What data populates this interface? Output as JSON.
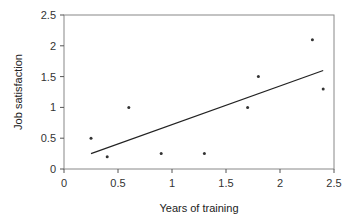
{
  "chart_data": {
    "type": "scatter",
    "title": "",
    "xlabel": "Years of training",
    "ylabel": "Job satisfaction",
    "xlim": [
      0,
      2.5
    ],
    "ylim": [
      0,
      2.5
    ],
    "xticks": [
      "0",
      "0.5",
      "1",
      "1.5",
      "2",
      "2.5"
    ],
    "yticks": [
      "0",
      "0.5",
      "1",
      "1.5",
      "2",
      "2.5"
    ],
    "grid": false,
    "legend": null,
    "series": [
      {
        "name": "observations",
        "points": [
          {
            "x": 0.25,
            "y": 0.5
          },
          {
            "x": 0.4,
            "y": 0.2
          },
          {
            "x": 0.6,
            "y": 1.0
          },
          {
            "x": 0.9,
            "y": 0.25
          },
          {
            "x": 1.3,
            "y": 0.25
          },
          {
            "x": 1.7,
            "y": 1.0
          },
          {
            "x": 1.8,
            "y": 1.5
          },
          {
            "x": 2.3,
            "y": 2.1
          },
          {
            "x": 2.4,
            "y": 1.3
          }
        ]
      },
      {
        "name": "regression line",
        "kind": "line",
        "points": [
          {
            "x": 0.25,
            "y": 0.25
          },
          {
            "x": 2.4,
            "y": 1.6
          }
        ]
      }
    ]
  },
  "colors": {
    "axis": "#555555",
    "points": "#333333",
    "line": "#222222"
  }
}
